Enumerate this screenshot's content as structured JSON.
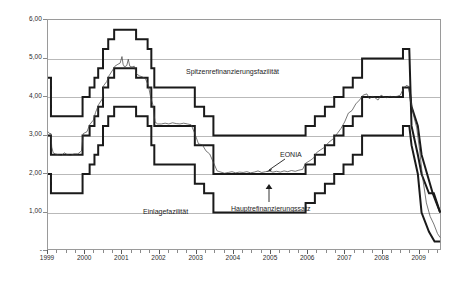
{
  "figure": {
    "kind": "line-chart",
    "background": "#ffffff",
    "frame_color": "#9a9a9a",
    "grid_color": "#b9b9b9",
    "band_color": "#1a1a1a",
    "eonia_color": "#3d3d3d"
  },
  "axes": {
    "y_ticks": [
      "6,00",
      "5,00",
      "4,00",
      "3,00",
      "2,00",
      "1,00",
      "-"
    ],
    "y_values": [
      6,
      5,
      4,
      3,
      2,
      1,
      0
    ],
    "y_min": 0,
    "y_max": 6,
    "x_ticks": [
      "1999",
      "2000",
      "2001",
      "2002",
      "2003",
      "2004",
      "2005",
      "2006",
      "2007",
      "2008",
      "2009"
    ],
    "x_min": 1999,
    "x_max": 2009.6,
    "grid": "horizontal"
  },
  "annotations": [
    {
      "name": "spitzenrefinanzierungsfazilitaet-label",
      "text": "Spitzenrefinanzierungsfazilität",
      "x": 186,
      "y": 68
    },
    {
      "name": "einlagefazilitaet-label",
      "text": "Einlagefazilität",
      "x": 143,
      "y": 208
    },
    {
      "name": "hauptrefinanzierungssatz-label",
      "text": "Hauptrefinanzierungssatz",
      "x": 231,
      "y": 205
    },
    {
      "name": "eonia-label",
      "text": "EONIA",
      "x": 280,
      "y": 154
    }
  ],
  "chart_data": {
    "type": "line",
    "title": "",
    "xlabel": "",
    "ylabel": "",
    "xlim": [
      1999,
      2009.6
    ],
    "ylim": [
      0,
      6
    ],
    "grid": true,
    "legend": "inline-annotations",
    "series": [
      {
        "name": "Spitzenrefinanzierungsfazilität",
        "style": "step",
        "points": [
          [
            1999.0,
            4.5
          ],
          [
            1999.08,
            4.5
          ],
          [
            1999.08,
            3.5
          ],
          [
            1999.93,
            3.5
          ],
          [
            1999.93,
            4.0
          ],
          [
            2000.12,
            4.0
          ],
          [
            2000.12,
            4.25
          ],
          [
            2000.25,
            4.25
          ],
          [
            2000.25,
            4.5
          ],
          [
            2000.35,
            4.5
          ],
          [
            2000.35,
            4.75
          ],
          [
            2000.48,
            4.75
          ],
          [
            2000.48,
            5.25
          ],
          [
            2000.62,
            5.25
          ],
          [
            2000.62,
            5.5
          ],
          [
            2000.78,
            5.5
          ],
          [
            2000.78,
            5.75
          ],
          [
            2001.37,
            5.75
          ],
          [
            2001.37,
            5.5
          ],
          [
            2001.68,
            5.5
          ],
          [
            2001.68,
            5.25
          ],
          [
            2001.78,
            5.25
          ],
          [
            2001.78,
            4.75
          ],
          [
            2001.86,
            4.75
          ],
          [
            2001.86,
            4.25
          ],
          [
            2002.95,
            4.25
          ],
          [
            2002.95,
            3.75
          ],
          [
            2003.2,
            3.75
          ],
          [
            2003.2,
            3.5
          ],
          [
            2003.45,
            3.5
          ],
          [
            2003.45,
            3.0
          ],
          [
            2005.93,
            3.0
          ],
          [
            2005.93,
            3.25
          ],
          [
            2006.18,
            3.25
          ],
          [
            2006.18,
            3.5
          ],
          [
            2006.45,
            3.5
          ],
          [
            2006.45,
            3.75
          ],
          [
            2006.7,
            3.75
          ],
          [
            2006.7,
            4.0
          ],
          [
            2006.95,
            4.0
          ],
          [
            2006.95,
            4.25
          ],
          [
            2007.2,
            4.25
          ],
          [
            2007.2,
            4.5
          ],
          [
            2007.45,
            4.5
          ],
          [
            2007.45,
            5.0
          ],
          [
            2008.55,
            5.0
          ],
          [
            2008.55,
            5.25
          ],
          [
            2008.72,
            5.25
          ],
          [
            2008.78,
            3.25
          ],
          [
            2008.95,
            2.5
          ],
          [
            2009.05,
            2.0
          ],
          [
            2009.25,
            1.5
          ],
          [
            2009.38,
            1.5
          ],
          [
            2009.55,
            1.0
          ]
        ]
      },
      {
        "name": "Hauptrefinanzierungssatz",
        "style": "step",
        "points": [
          [
            1999.0,
            3.0
          ],
          [
            1999.08,
            3.0
          ],
          [
            1999.08,
            2.5
          ],
          [
            1999.93,
            2.5
          ],
          [
            1999.93,
            3.0
          ],
          [
            2000.12,
            3.0
          ],
          [
            2000.12,
            3.25
          ],
          [
            2000.25,
            3.25
          ],
          [
            2000.25,
            3.5
          ],
          [
            2000.35,
            3.5
          ],
          [
            2000.35,
            3.75
          ],
          [
            2000.48,
            3.75
          ],
          [
            2000.48,
            4.25
          ],
          [
            2000.62,
            4.25
          ],
          [
            2000.62,
            4.5
          ],
          [
            2000.78,
            4.5
          ],
          [
            2000.78,
            4.75
          ],
          [
            2001.37,
            4.75
          ],
          [
            2001.37,
            4.5
          ],
          [
            2001.68,
            4.5
          ],
          [
            2001.68,
            4.25
          ],
          [
            2001.78,
            4.25
          ],
          [
            2001.78,
            3.75
          ],
          [
            2001.86,
            3.75
          ],
          [
            2001.86,
            3.25
          ],
          [
            2002.95,
            3.25
          ],
          [
            2002.95,
            2.75
          ],
          [
            2003.45,
            2.75
          ],
          [
            2003.45,
            2.0
          ],
          [
            2005.93,
            2.0
          ],
          [
            2005.93,
            2.25
          ],
          [
            2006.18,
            2.25
          ],
          [
            2006.18,
            2.5
          ],
          [
            2006.45,
            2.5
          ],
          [
            2006.45,
            2.75
          ],
          [
            2006.7,
            2.75
          ],
          [
            2006.7,
            3.0
          ],
          [
            2006.95,
            3.0
          ],
          [
            2006.95,
            3.25
          ],
          [
            2007.2,
            3.25
          ],
          [
            2007.2,
            3.5
          ],
          [
            2007.45,
            3.5
          ],
          [
            2007.45,
            4.0
          ],
          [
            2008.55,
            4.0
          ],
          [
            2008.55,
            4.25
          ],
          [
            2008.72,
            4.25
          ],
          [
            2008.78,
            3.75
          ],
          [
            2008.95,
            3.25
          ],
          [
            2009.05,
            2.5
          ],
          [
            2009.2,
            2.0
          ],
          [
            2009.35,
            1.5
          ],
          [
            2009.45,
            1.25
          ],
          [
            2009.55,
            1.0
          ]
        ]
      },
      {
        "name": "Einlagefazilität",
        "style": "step",
        "points": [
          [
            1999.0,
            2.0
          ],
          [
            1999.08,
            2.0
          ],
          [
            1999.08,
            1.5
          ],
          [
            1999.93,
            1.5
          ],
          [
            1999.93,
            2.0
          ],
          [
            2000.12,
            2.0
          ],
          [
            2000.12,
            2.25
          ],
          [
            2000.25,
            2.25
          ],
          [
            2000.25,
            2.5
          ],
          [
            2000.35,
            2.5
          ],
          [
            2000.35,
            2.75
          ],
          [
            2000.48,
            2.75
          ],
          [
            2000.48,
            3.25
          ],
          [
            2000.62,
            3.25
          ],
          [
            2000.62,
            3.5
          ],
          [
            2000.78,
            3.5
          ],
          [
            2000.78,
            3.75
          ],
          [
            2001.37,
            3.75
          ],
          [
            2001.37,
            3.5
          ],
          [
            2001.68,
            3.5
          ],
          [
            2001.68,
            3.25
          ],
          [
            2001.78,
            3.25
          ],
          [
            2001.78,
            2.75
          ],
          [
            2001.86,
            2.75
          ],
          [
            2001.86,
            2.25
          ],
          [
            2002.95,
            2.25
          ],
          [
            2002.95,
            1.75
          ],
          [
            2003.2,
            1.75
          ],
          [
            2003.2,
            1.5
          ],
          [
            2003.45,
            1.5
          ],
          [
            2003.45,
            1.0
          ],
          [
            2005.93,
            1.0
          ],
          [
            2005.93,
            1.25
          ],
          [
            2006.18,
            1.25
          ],
          [
            2006.18,
            1.5
          ],
          [
            2006.45,
            1.5
          ],
          [
            2006.45,
            1.75
          ],
          [
            2006.7,
            1.75
          ],
          [
            2006.7,
            2.0
          ],
          [
            2006.95,
            2.0
          ],
          [
            2006.95,
            2.25
          ],
          [
            2007.2,
            2.25
          ],
          [
            2007.2,
            2.5
          ],
          [
            2007.45,
            2.5
          ],
          [
            2007.45,
            3.0
          ],
          [
            2008.55,
            3.0
          ],
          [
            2008.55,
            3.25
          ],
          [
            2008.72,
            3.25
          ],
          [
            2008.78,
            2.75
          ],
          [
            2008.95,
            2.0
          ],
          [
            2009.05,
            1.0
          ],
          [
            2009.25,
            0.5
          ],
          [
            2009.4,
            0.25
          ],
          [
            2009.55,
            0.25
          ]
        ]
      },
      {
        "name": "EONIA",
        "style": "daily",
        "note": "noisy daily overnight rate tracking just above the main refinancing rate",
        "points": [
          [
            1999.0,
            3.1
          ],
          [
            1999.04,
            3.05
          ],
          [
            1999.08,
            3.05
          ],
          [
            1999.1,
            2.7
          ],
          [
            1999.14,
            2.55
          ],
          [
            1999.2,
            2.52
          ],
          [
            1999.28,
            2.5
          ],
          [
            1999.36,
            2.48
          ],
          [
            1999.44,
            2.55
          ],
          [
            1999.52,
            2.5
          ],
          [
            1999.6,
            2.48
          ],
          [
            1999.7,
            2.52
          ],
          [
            1999.8,
            2.52
          ],
          [
            1999.9,
            2.6
          ],
          [
            1999.95,
            3.05
          ],
          [
            2000.05,
            3.1
          ],
          [
            2000.12,
            3.28
          ],
          [
            2000.22,
            3.4
          ],
          [
            2000.28,
            3.6
          ],
          [
            2000.36,
            3.8
          ],
          [
            2000.46,
            3.95
          ],
          [
            2000.5,
            4.3
          ],
          [
            2000.58,
            4.4
          ],
          [
            2000.64,
            4.55
          ],
          [
            2000.74,
            4.7
          ],
          [
            2000.8,
            4.8
          ],
          [
            2000.88,
            4.85
          ],
          [
            2000.94,
            4.88
          ],
          [
            2000.99,
            5.05
          ],
          [
            2001.02,
            4.85
          ],
          [
            2001.06,
            4.78
          ],
          [
            2001.12,
            4.82
          ],
          [
            2001.16,
            4.98
          ],
          [
            2001.2,
            4.8
          ],
          [
            2001.26,
            4.78
          ],
          [
            2001.32,
            4.8
          ],
          [
            2001.38,
            4.6
          ],
          [
            2001.46,
            4.55
          ],
          [
            2001.54,
            4.52
          ],
          [
            2001.62,
            4.48
          ],
          [
            2001.7,
            4.3
          ],
          [
            2001.76,
            4.0
          ],
          [
            2001.82,
            3.8
          ],
          [
            2001.88,
            3.35
          ],
          [
            2001.95,
            3.3
          ],
          [
            2002.05,
            3.3
          ],
          [
            2002.15,
            3.32
          ],
          [
            2002.25,
            3.3
          ],
          [
            2002.35,
            3.33
          ],
          [
            2002.45,
            3.31
          ],
          [
            2002.55,
            3.3
          ],
          [
            2002.65,
            3.32
          ],
          [
            2002.75,
            3.3
          ],
          [
            2002.85,
            3.28
          ],
          [
            2002.95,
            3.05
          ],
          [
            2003.05,
            2.78
          ],
          [
            2003.15,
            2.76
          ],
          [
            2003.25,
            2.6
          ],
          [
            2003.35,
            2.52
          ],
          [
            2003.45,
            2.3
          ],
          [
            2003.55,
            2.08
          ],
          [
            2003.65,
            2.05
          ],
          [
            2003.75,
            2.02
          ],
          [
            2003.85,
            2.04
          ],
          [
            2003.95,
            2.06
          ],
          [
            2004.05,
            2.03
          ],
          [
            2004.15,
            2.05
          ],
          [
            2004.25,
            2.04
          ],
          [
            2004.35,
            2.06
          ],
          [
            2004.45,
            2.03
          ],
          [
            2004.55,
            2.05
          ],
          [
            2004.65,
            2.08
          ],
          [
            2004.75,
            2.04
          ],
          [
            2004.85,
            2.06
          ],
          [
            2004.95,
            2.08
          ],
          [
            2005.05,
            2.05
          ],
          [
            2005.15,
            2.07
          ],
          [
            2005.25,
            2.05
          ],
          [
            2005.35,
            2.08
          ],
          [
            2005.45,
            2.06
          ],
          [
            2005.55,
            2.09
          ],
          [
            2005.65,
            2.07
          ],
          [
            2005.75,
            2.1
          ],
          [
            2005.85,
            2.12
          ],
          [
            2005.93,
            2.28
          ],
          [
            2006.05,
            2.35
          ],
          [
            2006.15,
            2.42
          ],
          [
            2006.22,
            2.55
          ],
          [
            2006.32,
            2.62
          ],
          [
            2006.45,
            2.7
          ],
          [
            2006.55,
            2.82
          ],
          [
            2006.68,
            2.92
          ],
          [
            2006.78,
            3.05
          ],
          [
            2006.88,
            3.18
          ],
          [
            2006.98,
            3.35
          ],
          [
            2007.08,
            3.58
          ],
          [
            2007.18,
            3.65
          ],
          [
            2007.28,
            3.82
          ],
          [
            2007.38,
            3.92
          ],
          [
            2007.48,
            4.05
          ],
          [
            2007.58,
            4.08
          ],
          [
            2007.65,
            3.95
          ],
          [
            2007.72,
            4.02
          ],
          [
            2007.8,
            3.98
          ],
          [
            2007.88,
            3.92
          ],
          [
            2007.96,
            4.05
          ],
          [
            2008.04,
            4.0
          ],
          [
            2008.12,
            3.98
          ],
          [
            2008.2,
            4.02
          ],
          [
            2008.3,
            4.0
          ],
          [
            2008.4,
            4.02
          ],
          [
            2008.48,
            4.05
          ],
          [
            2008.56,
            4.22
          ],
          [
            2008.64,
            4.3
          ],
          [
            2008.7,
            4.28
          ],
          [
            2008.76,
            3.9
          ],
          [
            2008.84,
            3.5
          ],
          [
            2008.92,
            3.2
          ],
          [
            2009.0,
            2.6
          ],
          [
            2009.08,
            1.9
          ],
          [
            2009.18,
            1.25
          ],
          [
            2009.28,
            0.9
          ],
          [
            2009.38,
            0.7
          ],
          [
            2009.48,
            0.45
          ],
          [
            2009.55,
            0.35
          ]
        ]
      }
    ]
  }
}
